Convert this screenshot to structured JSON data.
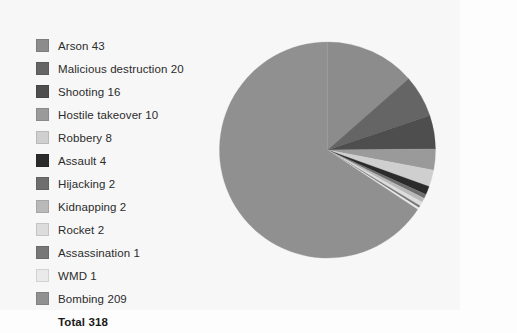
{
  "chart_data": {
    "type": "pie",
    "title": "",
    "xlabel": "",
    "ylabel": "",
    "legend_position": "left",
    "grid": false,
    "start_angle_deg": 0,
    "direction": "clockwise",
    "total_label": "Total 318",
    "total_value": 318,
    "categories": [
      "Arson",
      "Malicious destruction",
      "Shooting",
      "Hostile takeover",
      "Robbery",
      "Assault",
      "Hijacking",
      "Kidnapping",
      "Rocket",
      "Assassination",
      "WMD",
      "Bombing"
    ],
    "values": [
      43,
      20,
      16,
      10,
      8,
      4,
      2,
      2,
      2,
      1,
      1,
      209
    ],
    "colors": [
      "#8c8c8c",
      "#656565",
      "#4e4e4e",
      "#9a9a9a",
      "#cfcfcf",
      "#2b2b2b",
      "#6e6e6e",
      "#b9b9b9",
      "#dcdcdc",
      "#777777",
      "#eaeaea",
      "#909090"
    ]
  },
  "legend": {
    "items": [
      {
        "label": "Arson 43",
        "name": "Arson",
        "value": 43,
        "color": "#8c8c8c"
      },
      {
        "label": "Malicious destruction 20",
        "name": "Malicious destruction",
        "value": 20,
        "color": "#656565"
      },
      {
        "label": "Shooting 16",
        "name": "Shooting",
        "value": 16,
        "color": "#4e4e4e"
      },
      {
        "label": "Hostile takeover 10",
        "name": "Hostile takeover",
        "value": 10,
        "color": "#9a9a9a"
      },
      {
        "label": "Robbery 8",
        "name": "Robbery",
        "value": 8,
        "color": "#cfcfcf"
      },
      {
        "label": "Assault 4",
        "name": "Assault",
        "value": 4,
        "color": "#2b2b2b"
      },
      {
        "label": "Hijacking 2",
        "name": "Hijacking",
        "value": 2,
        "color": "#6e6e6e"
      },
      {
        "label": "Kidnapping 2",
        "name": "Kidnapping",
        "value": 2,
        "color": "#b9b9b9"
      },
      {
        "label": "Rocket 2",
        "name": "Rocket",
        "value": 2,
        "color": "#dcdcdc"
      },
      {
        "label": "Assassination 1",
        "name": "Assassination",
        "value": 1,
        "color": "#777777"
      },
      {
        "label": "WMD 1",
        "name": "WMD",
        "value": 1,
        "color": "#eaeaea"
      },
      {
        "label": "Bombing 209",
        "name": "Bombing",
        "value": 209,
        "color": "#909090"
      }
    ],
    "total_label": "Total 318"
  }
}
